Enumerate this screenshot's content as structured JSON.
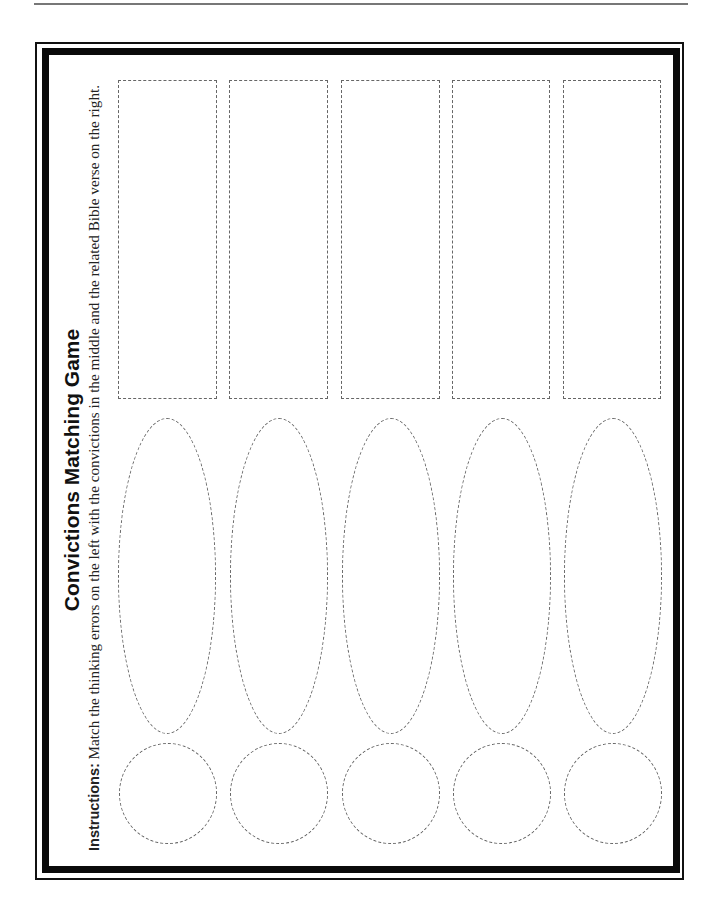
{
  "worksheet": {
    "title": "Convictions Matching Game",
    "instructions_label": "Instructions:",
    "instructions_text": " Match the thinking errors on the left with the convictions in the middle and the related Bible verse on the right."
  },
  "columns": [
    {
      "index": 1,
      "thinking_error_shape": "circle",
      "conviction_shape": "ellipse",
      "bible_verse_shape": "rectangle"
    },
    {
      "index": 2,
      "thinking_error_shape": "circle",
      "conviction_shape": "ellipse",
      "bible_verse_shape": "rectangle"
    },
    {
      "index": 3,
      "thinking_error_shape": "circle",
      "conviction_shape": "ellipse",
      "bible_verse_shape": "rectangle"
    },
    {
      "index": 4,
      "thinking_error_shape": "circle",
      "conviction_shape": "ellipse",
      "bible_verse_shape": "rectangle"
    },
    {
      "index": 5,
      "thinking_error_shape": "circle",
      "conviction_shape": "ellipse",
      "bible_verse_shape": "rectangle"
    }
  ],
  "colors": {
    "frame": "#0a0a0a",
    "dashed_outline": "#666666",
    "background": "#ffffff"
  }
}
